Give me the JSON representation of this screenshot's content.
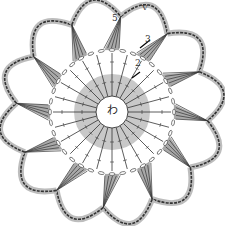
{
  "diagram": {
    "type": "crochet-chart",
    "center_label": "わ",
    "round_labels": [
      {
        "text": "5",
        "x": 112,
        "y": 16
      },
      {
        "text": "3",
        "x": 145,
        "y": 37
      },
      {
        "text": "2",
        "x": 136,
        "y": 61
      }
    ],
    "start_mark": {
      "text": "V",
      "x": 143,
      "y": 8
    },
    "petal_count": 12,
    "colors": {
      "ring_fill": "#c8c8c8",
      "wedge_fill": "#a9a9a9",
      "stroke": "#333333",
      "petal_shadow": "#bdbdbd"
    }
  }
}
